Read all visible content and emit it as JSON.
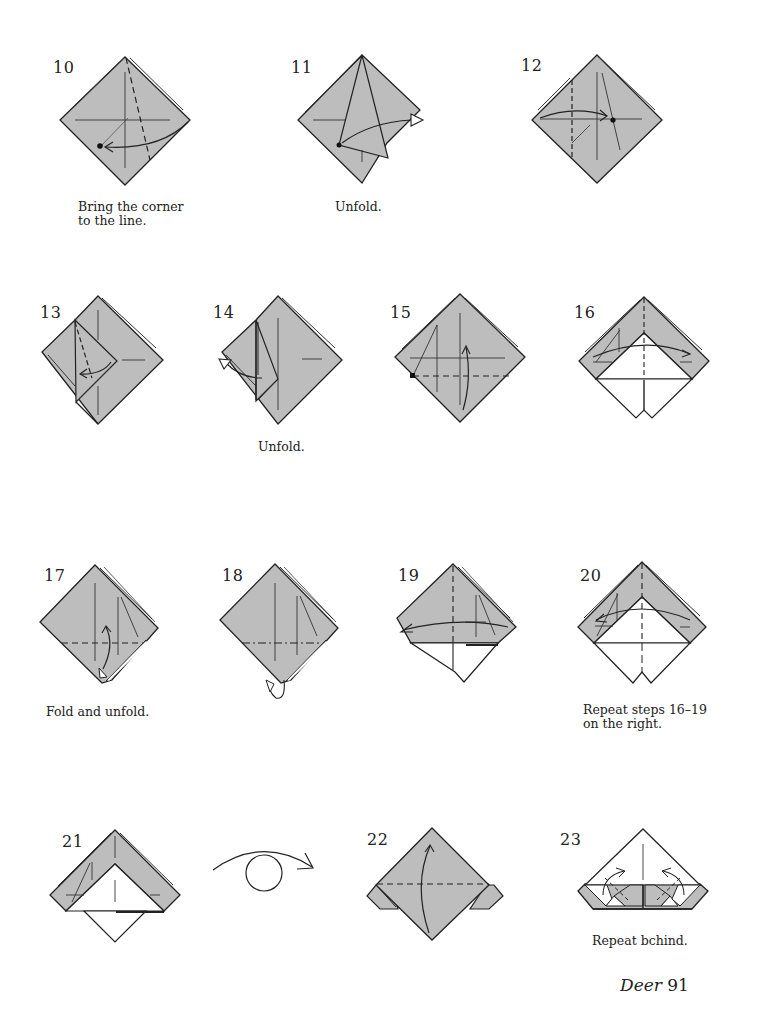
{
  "page": {
    "title": "Deer",
    "number": "91",
    "paper_color": "#bdbdbd",
    "line_color": "#222222"
  },
  "steps": [
    {
      "num": "10",
      "caption": "Bring the corner\nto the line."
    },
    {
      "num": "11",
      "caption": "Unfold."
    },
    {
      "num": "12",
      "caption": ""
    },
    {
      "num": "13",
      "caption": ""
    },
    {
      "num": "14",
      "caption": "Unfold."
    },
    {
      "num": "15",
      "caption": ""
    },
    {
      "num": "16",
      "caption": ""
    },
    {
      "num": "17",
      "caption": "Fold and unfold."
    },
    {
      "num": "18",
      "caption": ""
    },
    {
      "num": "19",
      "caption": ""
    },
    {
      "num": "20",
      "caption": "Repeat steps 16–19\non the right."
    },
    {
      "num": "21",
      "caption": ""
    },
    {
      "num": "turn-over",
      "caption": ""
    },
    {
      "num": "22",
      "caption": ""
    },
    {
      "num": "23",
      "caption": "Repeat bchind."
    }
  ]
}
